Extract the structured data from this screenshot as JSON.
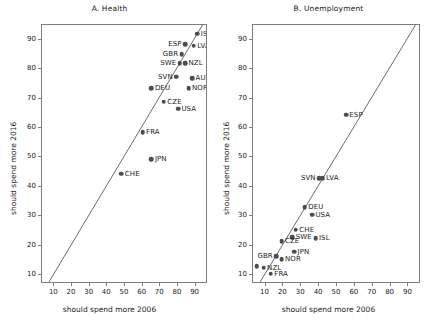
{
  "figure": {
    "axis_x_label": "should spend more 2006",
    "axis_y_label": "should spend more 2016",
    "tick_labels": [
      "10",
      "20",
      "30",
      "40",
      "50",
      "60",
      "70",
      "80",
      "90"
    ],
    "point_color": "#4d4d4d",
    "line_color": "#6a6a6a",
    "frame_color": "#7d7d7d"
  },
  "chart_data": [
    {
      "type": "scatter",
      "title": "A. Health",
      "xlabel": "should spend more 2006",
      "ylabel": "should spend more 2016",
      "xlim": [
        3,
        97
      ],
      "ylim": [
        7,
        95
      ],
      "xticks": [
        10,
        20,
        30,
        40,
        50,
        60,
        70,
        80,
        90
      ],
      "yticks": [
        10,
        20,
        30,
        40,
        50,
        60,
        70,
        80,
        90
      ],
      "grid": false,
      "legend": "none",
      "annotations": [
        "45-degree reference line (y = x)"
      ],
      "points": [
        {
          "label": "ISL",
          "x": 91.0,
          "y": 92.0,
          "lpos": "r"
        },
        {
          "label": "LVA",
          "x": 89.0,
          "y": 88.0,
          "lpos": "r"
        },
        {
          "label": "ESP",
          "x": 84.0,
          "y": 88.5,
          "lpos": "l"
        },
        {
          "label": "GBR",
          "x": 82.0,
          "y": 85.0,
          "lpos": "l"
        },
        {
          "label": "NZL",
          "x": 84.0,
          "y": 82.0,
          "lpos": "r"
        },
        {
          "label": "SWE",
          "x": 81.0,
          "y": 82.0,
          "lpos": "l"
        },
        {
          "label": "AUS",
          "x": 88.0,
          "y": 77.0,
          "lpos": "r"
        },
        {
          "label": "SVN",
          "x": 79.0,
          "y": 77.5,
          "lpos": "l"
        },
        {
          "label": "NOR",
          "x": 86.0,
          "y": 73.5,
          "lpos": "r"
        },
        {
          "label": "DEU",
          "x": 65.0,
          "y": 73.5,
          "lpos": "r"
        },
        {
          "label": "CZE",
          "x": 72.0,
          "y": 69.0,
          "lpos": "r"
        },
        {
          "label": "USA",
          "x": 80.0,
          "y": 66.5,
          "lpos": "r"
        },
        {
          "label": "FRA",
          "x": 60.0,
          "y": 58.5,
          "lpos": "r"
        },
        {
          "label": "JPN",
          "x": 65.0,
          "y": 49.5,
          "lpos": "r"
        },
        {
          "label": "CHE",
          "x": 48.0,
          "y": 44.5,
          "lpos": "r"
        }
      ]
    },
    {
      "type": "scatter",
      "title": "B. Unemployment",
      "xlabel": "should spend more 2006",
      "ylabel": "should spend more 2016",
      "xlim": [
        3,
        97
      ],
      "ylim": [
        7,
        95
      ],
      "xticks": [
        10,
        20,
        30,
        40,
        50,
        60,
        70,
        80,
        90
      ],
      "yticks": [
        10,
        20,
        30,
        40,
        50,
        60,
        70,
        80,
        90
      ],
      "grid": false,
      "legend": "none",
      "annotations": [
        "45-degree reference line (y = x)"
      ],
      "points": [
        {
          "label": "ESP",
          "x": 55.0,
          "y": 64.5,
          "lpos": "r"
        },
        {
          "label": "LVA",
          "x": 42.0,
          "y": 43.0,
          "lpos": "r"
        },
        {
          "label": "SVN",
          "x": 40.0,
          "y": 43.0,
          "lpos": "l"
        },
        {
          "label": "DEU",
          "x": 32.0,
          "y": 33.0,
          "lpos": "r"
        },
        {
          "label": "USA",
          "x": 36.0,
          "y": 30.5,
          "lpos": "r"
        },
        {
          "label": "CHE",
          "x": 27.0,
          "y": 25.5,
          "lpos": "r"
        },
        {
          "label": "SWE",
          "x": 25.0,
          "y": 23.0,
          "lpos": "r"
        },
        {
          "label": "ISL",
          "x": 38.0,
          "y": 22.5,
          "lpos": "r"
        },
        {
          "label": "CZE",
          "x": 19.0,
          "y": 21.5,
          "lpos": "r"
        },
        {
          "label": "JPN",
          "x": 26.0,
          "y": 18.0,
          "lpos": "r"
        },
        {
          "label": "GBR",
          "x": 16.0,
          "y": 16.5,
          "lpos": "l"
        },
        {
          "label": "NOR",
          "x": 19.0,
          "y": 15.5,
          "lpos": "r"
        },
        {
          "label": "AUS",
          "x": 5.0,
          "y": 13.0,
          "lpos": "l"
        },
        {
          "label": "NZL",
          "x": 9.0,
          "y": 12.5,
          "lpos": "r"
        },
        {
          "label": "FRA",
          "x": 13.0,
          "y": 10.5,
          "lpos": "r"
        }
      ]
    }
  ]
}
